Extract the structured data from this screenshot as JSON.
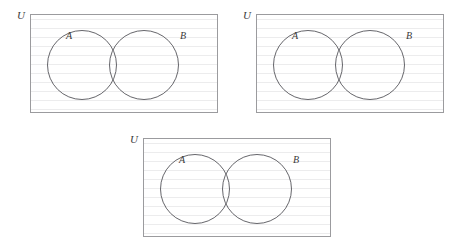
{
  "figure": {
    "type": "venn-diagram-set",
    "background_color": "#ffffff",
    "count": 3
  },
  "style": {
    "frame_border_color": "#9b9b9e",
    "circle_stroke_color": "#55555a",
    "rule_line_color": "#ececed",
    "label_color": "#3a3a3a"
  },
  "diagrams": [
    {
      "id": "diagram-1",
      "position": {
        "left": 30,
        "top": 14
      },
      "frame": {
        "width": 188,
        "height": 99
      },
      "universe_label": "U",
      "sets": [
        {
          "name": "A",
          "label": "A",
          "label_left": 36,
          "label_top": 17,
          "cx": 51,
          "cy": 50,
          "r": 34.5
        },
        {
          "name": "B",
          "label": "B",
          "label_left": 150,
          "label_top": 17,
          "cx": 113,
          "cy": 50,
          "r": 34.5
        }
      ]
    },
    {
      "id": "diagram-2",
      "position": {
        "left": 256,
        "top": 14
      },
      "frame": {
        "width": 188,
        "height": 99
      },
      "universe_label": "U",
      "sets": [
        {
          "name": "A",
          "label": "A",
          "label_left": 36,
          "label_top": 17,
          "cx": 51,
          "cy": 50,
          "r": 34.5
        },
        {
          "name": "B",
          "label": "B",
          "label_left": 150,
          "label_top": 17,
          "cx": 113,
          "cy": 50,
          "r": 34.5
        }
      ]
    },
    {
      "id": "diagram-3",
      "position": {
        "left": 143,
        "top": 138
      },
      "frame": {
        "width": 188,
        "height": 99
      },
      "universe_label": "U",
      "sets": [
        {
          "name": "A",
          "label": "A",
          "label_left": 36,
          "label_top": 17,
          "cx": 51,
          "cy": 50,
          "r": 34.5
        },
        {
          "name": "B",
          "label": "B",
          "label_left": 150,
          "label_top": 17,
          "cx": 113,
          "cy": 50,
          "r": 34.5
        }
      ]
    }
  ]
}
